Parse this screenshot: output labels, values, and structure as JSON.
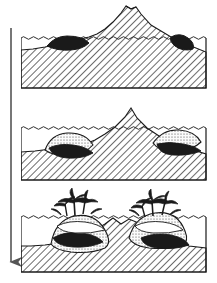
{
  "figure": {
    "type": "geological cross-section sequence",
    "stage_count": 3,
    "background_color": "#ffffff",
    "line_color": "#1a1a1a",
    "reef_dark_color": "#1a1a1a",
    "reef_light_color": "#f2f2f2",
    "rock_hatch_color": "#4a4a4a"
  },
  "subsidence_arrow": {
    "icon": "down-arrow-icon",
    "meaning": "subsidence over time",
    "x": 11,
    "y_top": 28,
    "y_bottom": 270,
    "color": "#555555"
  },
  "panels": [
    {
      "id": "stage-1",
      "label": "volcanic island with fringing reef",
      "frame": {
        "x": 21,
        "y": 38,
        "width": 185,
        "height": 50
      },
      "sea_level_y": 38,
      "peak": {
        "x": 113,
        "y": 6,
        "has_crater": true
      },
      "reefs": [
        {
          "side": "left",
          "type": "fringing",
          "dark": true,
          "stippled": false
        },
        {
          "side": "right",
          "type": "fringing",
          "dark": true,
          "stippled": false
        }
      ],
      "islands_above_water": 1,
      "palms": 0
    },
    {
      "id": "stage-2",
      "label": "subsiding island with barrier reef",
      "frame": {
        "x": 21,
        "y": 128,
        "width": 185,
        "height": 52
      },
      "sea_level_y": 128,
      "peak": {
        "x": 110,
        "y": 108,
        "has_crater": false
      },
      "reefs": [
        {
          "side": "left",
          "type": "barrier",
          "dark": true,
          "stippled": true
        },
        {
          "side": "right",
          "type": "barrier",
          "dark": true,
          "stippled": true
        }
      ],
      "islands_above_water": 1,
      "palms": 0
    },
    {
      "id": "stage-3",
      "label": "atoll with coral islets and palms",
      "frame": {
        "x": 21,
        "y": 217,
        "width": 185,
        "height": 55
      },
      "sea_level_y": 217,
      "peak": {
        "x": 113,
        "y": 224,
        "has_crater": false
      },
      "reefs": [
        {
          "side": "left",
          "type": "atoll",
          "dark": true,
          "stippled": true
        },
        {
          "side": "right",
          "type": "atoll",
          "dark": true,
          "stippled": true
        }
      ],
      "islands_above_water": 2,
      "palms": 2
    }
  ]
}
